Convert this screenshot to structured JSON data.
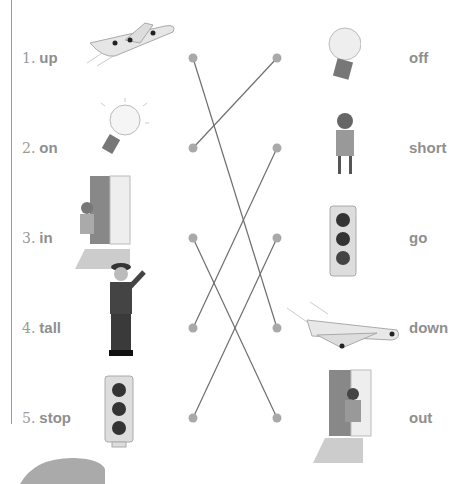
{
  "left_items": [
    {
      "number": "1.",
      "word": "up",
      "picture": "airplane-up-icon"
    },
    {
      "number": "2.",
      "word": "on",
      "picture": "lightbulb-on-icon"
    },
    {
      "number": "3.",
      "word": "in",
      "picture": "boy-entering-door-icon"
    },
    {
      "number": "4.",
      "word": "tall",
      "picture": "tall-man-icon"
    },
    {
      "number": "5.",
      "word": "stop",
      "picture": "traffic-light-stop-icon"
    }
  ],
  "right_items": [
    {
      "word": "off",
      "picture": "lightbulb-off-icon"
    },
    {
      "word": "short",
      "picture": "short-girl-icon"
    },
    {
      "word": "go",
      "picture": "traffic-light-go-icon"
    },
    {
      "word": "down",
      "picture": "airplane-down-icon"
    },
    {
      "word": "out",
      "picture": "girl-exiting-door-icon"
    }
  ],
  "connections": [
    {
      "from": "up",
      "to": "down"
    },
    {
      "from": "on",
      "to": "off"
    },
    {
      "from": "in",
      "to": "out"
    },
    {
      "from": "tall",
      "to": "short"
    },
    {
      "from": "stop",
      "to": "go"
    }
  ],
  "colors": {
    "line": "#6e6e6e",
    "dot": "#a9a9a9",
    "text": "#8f8f8f"
  }
}
